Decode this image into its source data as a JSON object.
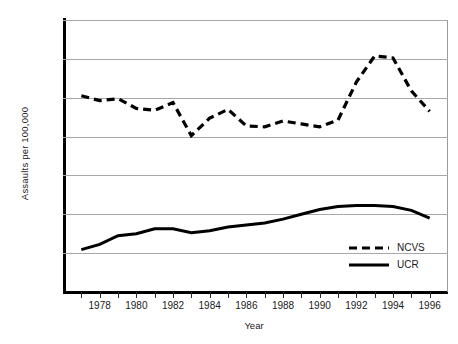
{
  "chart_data": {
    "type": "line",
    "title": "",
    "xlabel": "Year",
    "ylabel": "Assaults per 100,000",
    "xlim": [
      1976,
      1997
    ],
    "ylim": [
      0,
      1400
    ],
    "grid": true,
    "legend_position": "bottom-right",
    "y_ticks": [
      0,
      200,
      400,
      600,
      800,
      1000,
      1200,
      1400
    ],
    "y_tick_labels": [
      "0",
      "200",
      "400",
      "600",
      "800",
      "1000",
      "1200",
      "1400"
    ],
    "x_ticks": [
      1977,
      1978,
      1979,
      1980,
      1981,
      1982,
      1983,
      1984,
      1985,
      1986,
      1987,
      1988,
      1989,
      1990,
      1991,
      1992,
      1993,
      1994,
      1995,
      1996
    ],
    "x_tick_labels": [
      "1978",
      "1980",
      "1982",
      "1984",
      "1986",
      "1988",
      "1990",
      "1992",
      "1994",
      "1996"
    ],
    "x_labeled_years": [
      1978,
      1980,
      1982,
      1984,
      1986,
      1988,
      1990,
      1992,
      1994,
      1996
    ],
    "x": [
      1977,
      1978,
      1979,
      1980,
      1981,
      1982,
      1983,
      1984,
      1985,
      1986,
      1987,
      1988,
      1989,
      1990,
      1991,
      1992,
      1993,
      1994,
      1995,
      1996
    ],
    "series": [
      {
        "name": "NCVS",
        "style": "dashed",
        "color": "#000000",
        "values": [
          1010,
          985,
          995,
          945,
          935,
          975,
          805,
          895,
          940,
          855,
          850,
          880,
          865,
          850,
          885,
          1080,
          1215,
          1205,
          1035,
          930
        ]
      },
      {
        "name": "UCR",
        "style": "solid",
        "color": "#000000",
        "values": [
          218,
          245,
          290,
          300,
          325,
          325,
          305,
          315,
          335,
          345,
          355,
          375,
          400,
          425,
          440,
          445,
          445,
          440,
          420,
          380
        ]
      }
    ],
    "legend": [
      {
        "label": "NCVS",
        "style": "dashed"
      },
      {
        "label": "UCR",
        "style": "solid"
      }
    ]
  }
}
